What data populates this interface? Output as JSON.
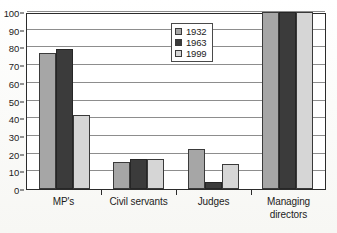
{
  "chart_data": {
    "type": "bar",
    "title": "",
    "subtitle": "",
    "xlabel": "",
    "ylabel": "",
    "ylim": [
      0,
      100
    ],
    "ytick_step": 10,
    "yticks": [
      0,
      10,
      20,
      30,
      40,
      50,
      60,
      70,
      80,
      90,
      100
    ],
    "grid": true,
    "legend_position": "top-center-right",
    "categories": [
      "MP's",
      "Civil servants",
      "Judges",
      "Managing directors"
    ],
    "series": [
      {
        "name": "1932",
        "color": "#a6a6a6",
        "values": [
          77,
          15,
          22.5,
          100
        ]
      },
      {
        "name": "1963",
        "color": "#3b3b3b",
        "values": [
          79,
          17,
          4,
          100
        ]
      },
      {
        "name": "1999",
        "color": "#d6d6d6",
        "values": [
          42,
          17,
          14,
          100
        ]
      }
    ]
  },
  "axes": {
    "y_tick_labels": [
      "100",
      "90",
      "80",
      "70",
      "60",
      "50",
      "40",
      "30",
      "20",
      "10",
      "0"
    ],
    "x_category_labels": [
      {
        "line1": "MP's",
        "line2": ""
      },
      {
        "line1": "Civil servants",
        "line2": ""
      },
      {
        "line1": "Judges",
        "line2": ""
      },
      {
        "line1": "Managing",
        "line2": "directors"
      }
    ]
  },
  "legend": {
    "entries": [
      {
        "label": "1932",
        "swatch": "legend-swatch-1932"
      },
      {
        "label": "1963",
        "swatch": "legend-swatch-1963"
      },
      {
        "label": "1999",
        "swatch": "legend-swatch-1999"
      }
    ]
  }
}
